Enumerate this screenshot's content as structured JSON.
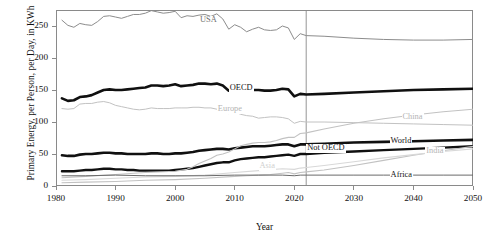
{
  "chart_data": {
    "type": "line",
    "title": "",
    "xlabel": "Year",
    "ylabel": "Primary Energy, per Person, per Day, in KWh",
    "xlim": [
      1980,
      2050
    ],
    "ylim": [
      0,
      275
    ],
    "xticks": [
      1980,
      1990,
      2000,
      2010,
      2020,
      2030,
      2040,
      2050
    ],
    "yticks": [
      0,
      50,
      100,
      150,
      200,
      250
    ],
    "grid": false,
    "legend": "inline-labels",
    "annotations": [
      {
        "name": "projection-divider",
        "x": 2022,
        "note": "vertical line separating history from projection"
      }
    ],
    "series": [
      {
        "name": "USA",
        "color": "#8c8c8c",
        "width": 1.0,
        "label_x": 2004,
        "label_y": 258,
        "label_tone": "mid",
        "x": [
          1981,
          1982,
          1983,
          1984,
          1985,
          1986,
          1987,
          1988,
          1989,
          1990,
          1991,
          1992,
          1993,
          1994,
          1995,
          1996,
          1997,
          1998,
          1999,
          2000,
          2001,
          2002,
          2003,
          2004,
          2005,
          2006,
          2007,
          2008,
          2009,
          2010,
          2011,
          2012,
          2013,
          2014,
          2015,
          2016,
          2017,
          2018,
          2019,
          2020,
          2021,
          2022,
          2025,
          2030,
          2035,
          2040,
          2045,
          2050
        ],
        "y": [
          259,
          251,
          248,
          254,
          252,
          251,
          257,
          265,
          266,
          264,
          262,
          265,
          268,
          268,
          270,
          274,
          272,
          270,
          271,
          273,
          263,
          266,
          265,
          267,
          268,
          265,
          269,
          261,
          245,
          252,
          248,
          241,
          245,
          248,
          244,
          243,
          244,
          250,
          247,
          229,
          238,
          235,
          234,
          231,
          229,
          228,
          228,
          229
        ]
      },
      {
        "name": "OECD",
        "color": "#101010",
        "width": 2.6,
        "label_x": 2009,
        "label_y": 152,
        "label_tone": "dark",
        "x": [
          1981,
          1982,
          1983,
          1984,
          1985,
          1986,
          1987,
          1988,
          1989,
          1990,
          1991,
          1992,
          1993,
          1994,
          1995,
          1996,
          1997,
          1998,
          1999,
          2000,
          2001,
          2002,
          2003,
          2004,
          2005,
          2006,
          2007,
          2008,
          2009,
          2010,
          2011,
          2012,
          2013,
          2014,
          2015,
          2016,
          2017,
          2018,
          2019,
          2020,
          2021,
          2022,
          2025,
          2030,
          2035,
          2040,
          2045,
          2050
        ],
        "y": [
          137,
          133,
          134,
          139,
          140,
          142,
          146,
          150,
          151,
          150,
          150,
          151,
          152,
          153,
          154,
          157,
          157,
          156,
          157,
          159,
          156,
          157,
          158,
          160,
          160,
          159,
          160,
          157,
          149,
          153,
          151,
          149,
          150,
          150,
          149,
          149,
          150,
          152,
          151,
          140,
          144,
          143,
          144,
          146,
          148,
          150,
          151,
          152
        ]
      },
      {
        "name": "Europe",
        "color": "#c2c2c2",
        "width": 1.0,
        "label_x": 2007,
        "label_y": 119,
        "label_tone": "light",
        "x": [
          1981,
          1982,
          1983,
          1984,
          1985,
          1986,
          1987,
          1988,
          1989,
          1990,
          1991,
          1992,
          1993,
          1994,
          1995,
          1996,
          1997,
          1998,
          1999,
          2000,
          2001,
          2002,
          2003,
          2004,
          2005,
          2006,
          2007,
          2008,
          2009,
          2010,
          2011,
          2012,
          2013,
          2014,
          2015,
          2016,
          2017,
          2018,
          2019,
          2020,
          2021,
          2022,
          2025,
          2030,
          2035,
          2040,
          2045,
          2050
        ],
        "y": [
          121,
          120,
          121,
          128,
          129,
          129,
          131,
          132,
          130,
          126,
          124,
          122,
          120,
          119,
          120,
          122,
          121,
          121,
          121,
          122,
          122,
          122,
          123,
          123,
          122,
          122,
          120,
          120,
          113,
          116,
          112,
          110,
          109,
          106,
          107,
          108,
          108,
          107,
          105,
          98,
          101,
          100,
          100,
          99,
          98,
          97,
          96,
          95
        ]
      },
      {
        "name": "World",
        "color": "#101010",
        "width": 2.6,
        "label_x": 2036,
        "label_y": 70,
        "label_tone": "dark",
        "x": [
          1981,
          1982,
          1983,
          1984,
          1985,
          1986,
          1987,
          1988,
          1989,
          1990,
          1991,
          1992,
          1993,
          1994,
          1995,
          1996,
          1997,
          1998,
          1999,
          2000,
          2001,
          2002,
          2003,
          2004,
          2005,
          2006,
          2007,
          2008,
          2009,
          2010,
          2011,
          2012,
          2013,
          2014,
          2015,
          2016,
          2017,
          2018,
          2019,
          2020,
          2021,
          2022,
          2025,
          2030,
          2035,
          2040,
          2045,
          2050
        ],
        "y": [
          48,
          47,
          47,
          49,
          50,
          50,
          51,
          52,
          52,
          51,
          51,
          50,
          50,
          50,
          50,
          51,
          51,
          50,
          50,
          51,
          51,
          52,
          53,
          55,
          56,
          57,
          58,
          58,
          57,
          59,
          60,
          61,
          62,
          62,
          62,
          63,
          64,
          65,
          65,
          62,
          65,
          65,
          66,
          68,
          69,
          70,
          71,
          72
        ]
      },
      {
        "name": "Not OECD",
        "color": "#101010",
        "width": 2.4,
        "label_x": 2022,
        "label_y": 58,
        "label_tone": "dark",
        "x": [
          1981,
          1982,
          1983,
          1984,
          1985,
          1986,
          1987,
          1988,
          1989,
          1990,
          1991,
          1992,
          1993,
          1994,
          1995,
          1996,
          1997,
          1998,
          1999,
          2000,
          2001,
          2002,
          2003,
          2004,
          2005,
          2006,
          2007,
          2008,
          2009,
          2010,
          2011,
          2012,
          2013,
          2014,
          2015,
          2016,
          2017,
          2018,
          2019,
          2020,
          2021,
          2022,
          2025,
          2030,
          2035,
          2040,
          2045,
          2050
        ],
        "y": [
          23,
          23,
          23,
          24,
          25,
          25,
          26,
          27,
          27,
          26,
          26,
          25,
          25,
          24,
          24,
          24,
          24,
          24,
          24,
          25,
          26,
          27,
          28,
          30,
          32,
          34,
          36,
          37,
          37,
          40,
          42,
          43,
          44,
          45,
          45,
          46,
          47,
          48,
          49,
          47,
          50,
          50,
          52,
          54,
          56,
          58,
          60,
          62
        ]
      },
      {
        "name": "China",
        "color": "#c2c2c2",
        "width": 1.1,
        "label_x": 2038,
        "label_y": 107,
        "label_tone": "light",
        "x": [
          1981,
          1985,
          1990,
          1995,
          2000,
          2002,
          2003,
          2004,
          2005,
          2006,
          2007,
          2008,
          2009,
          2010,
          2011,
          2012,
          2013,
          2014,
          2015,
          2016,
          2017,
          2018,
          2019,
          2020,
          2021,
          2022,
          2025,
          2030,
          2035,
          2040,
          2045,
          2050
        ],
        "y": [
          13,
          15,
          18,
          21,
          23,
          26,
          30,
          35,
          39,
          43,
          48,
          50,
          53,
          58,
          63,
          65,
          67,
          68,
          68,
          69,
          71,
          74,
          76,
          76,
          82,
          83,
          89,
          98,
          105,
          111,
          116,
          120
        ]
      },
      {
        "name": "India",
        "color": "#c2c2c2",
        "width": 1.1,
        "label_x": 2042,
        "label_y": 54,
        "label_tone": "light",
        "x": [
          1981,
          1985,
          1990,
          1995,
          2000,
          2005,
          2010,
          2012,
          2014,
          2016,
          2018,
          2019,
          2020,
          2021,
          2022,
          2025,
          2030,
          2035,
          2040,
          2045,
          2050
        ],
        "y": [
          5,
          6,
          7,
          9,
          10,
          12,
          15,
          16,
          17,
          18,
          20,
          21,
          19,
          21,
          22,
          25,
          32,
          40,
          48,
          55,
          62
        ]
      },
      {
        "name": "Asia",
        "color": "#d8d8d8",
        "width": 1.1,
        "label_x": 2014,
        "label_y": 30,
        "label_tone": "vlight",
        "x": [
          1981,
          1985,
          1990,
          1995,
          2000,
          2005,
          2010,
          2014,
          2018,
          2020,
          2021,
          2022,
          2025,
          2030,
          2035,
          2040,
          2045,
          2050
        ],
        "y": [
          9,
          10,
          12,
          14,
          15,
          17,
          21,
          24,
          27,
          26,
          28,
          29,
          32,
          38,
          44,
          49,
          54,
          58
        ]
      },
      {
        "name": "Africa",
        "color": "#6a6a6a",
        "width": 1.0,
        "label_x": 2036,
        "label_y": 16,
        "label_tone": "dark",
        "x": [
          1981,
          1985,
          1990,
          1995,
          2000,
          2005,
          2010,
          2014,
          2018,
          2020,
          2021,
          2022,
          2025,
          2030,
          2035,
          2040,
          2045,
          2050
        ],
        "y": [
          16,
          16,
          17,
          16,
          16,
          16,
          17,
          17,
          17,
          16,
          17,
          17,
          17,
          17,
          17,
          17,
          17,
          17
        ]
      }
    ]
  }
}
